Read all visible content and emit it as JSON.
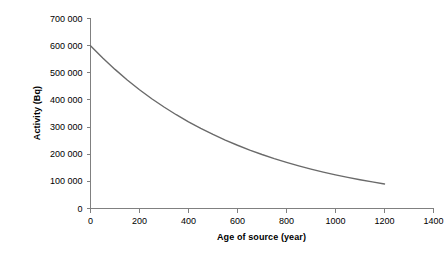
{
  "chart_data": {
    "type": "line",
    "title": "",
    "xlabel": "Age of source (year)",
    "ylabel": "Activity (Bq)",
    "xlim": [
      0,
      1400
    ],
    "ylim": [
      0,
      700000
    ],
    "xticks": [
      0,
      200,
      400,
      600,
      800,
      1000,
      1200,
      1400
    ],
    "xtick_labels": [
      "0",
      "200",
      "400",
      "600",
      "800",
      "1000",
      "1200",
      "1400"
    ],
    "yticks": [
      0,
      100000,
      200000,
      300000,
      400000,
      500000,
      600000,
      700000
    ],
    "ytick_labels": [
      "0",
      "100 000",
      "200 000",
      "300 000",
      "400 000",
      "500 000",
      "600 000",
      "700 000"
    ],
    "grid": false,
    "legend": false,
    "series": [
      {
        "name": "Activity",
        "color": "#6a6a6a",
        "line_width": 1.4,
        "x": [
          0,
          50,
          100,
          150,
          200,
          250,
          300,
          350,
          400,
          450,
          500,
          550,
          600,
          650,
          700,
          750,
          800,
          850,
          900,
          950,
          1000,
          1050,
          1100,
          1150,
          1200
        ],
        "y": [
          600000,
          554500,
          512500,
          473600,
          437700,
          404500,
          373900,
          345500,
          319300,
          295100,
          272800,
          252100,
          233000,
          215300,
          199000,
          183900,
          170000,
          157100,
          145200,
          134200,
          124000,
          114600,
          105900,
          97900,
          90500
        ]
      }
    ],
    "annotations": [],
    "axis_color": "#808080",
    "curve_start_value": 600000,
    "curve_end_value": 90500,
    "curve_end_age": 1200,
    "decay_half_life_years": 440
  },
  "figure": {
    "background": "#ffffff",
    "width": 444,
    "height": 257
  }
}
